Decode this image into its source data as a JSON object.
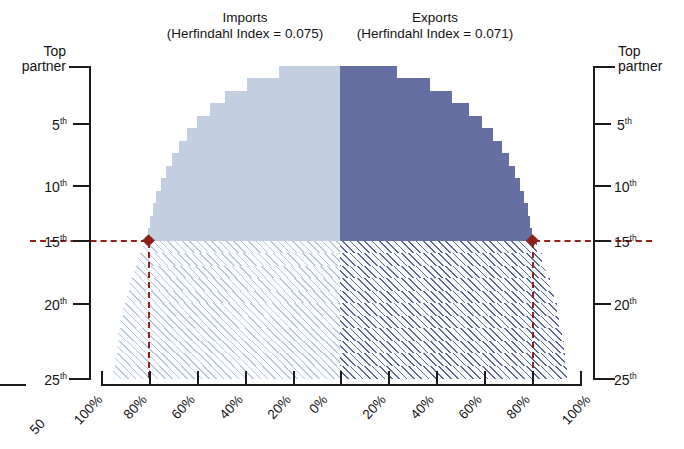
{
  "chart_data": {
    "type": "bar",
    "title": "",
    "subtitle": "",
    "orientation": "horizontal-mirrored",
    "xlabel": "",
    "ylabel": "",
    "panels": [
      {
        "name": "imports",
        "title_line1": "Imports",
        "title_line2": "(Herfindahl Index = 0.075)",
        "herfindahl_index": 0.075,
        "side": "left",
        "color": "#c3cfe0",
        "hatch_color": "#b9c7da",
        "direction": "right-to-left",
        "xlim": [
          0,
          100
        ],
        "categories": [
          "Top partner",
          "2nd",
          "3rd",
          "4th",
          "5th",
          "6th",
          "7th",
          "8th",
          "9th",
          "10th",
          "11th",
          "12th",
          "13th",
          "14th",
          "15th",
          "16th",
          "17th",
          "18th",
          "19th",
          "20th",
          "21st",
          "22nd",
          "23rd",
          "24th",
          "25th"
        ],
        "values": [
          25.5,
          39.0,
          48.0,
          54.5,
          60.0,
          64.0,
          67.5,
          70.5,
          73.0,
          75.0,
          76.8,
          78.2,
          79.4,
          80.2,
          82.5,
          84.5,
          86.3,
          87.9,
          89.3,
          90.6,
          91.7,
          92.7,
          93.5,
          94.2,
          94.8
        ],
        "solid_through_rank": 14,
        "hatched_from_rank": 15
      },
      {
        "name": "exports",
        "title_line1": "Exports",
        "title_line2": "(Herfindahl Index = 0.071)",
        "herfindahl_index": 0.071,
        "side": "right",
        "color": "#666fa2",
        "hatch_color": "#5d6798",
        "direction": "left-to-right",
        "xlim": [
          0,
          100
        ],
        "categories": [
          "Top partner",
          "2nd",
          "3rd",
          "4th",
          "5th",
          "6th",
          "7th",
          "8th",
          "9th",
          "10th",
          "11th",
          "12th",
          "13th",
          "14th",
          "15th",
          "16th",
          "17th",
          "18th",
          "19th",
          "20th",
          "21st",
          "22nd",
          "23rd",
          "24th",
          "25th"
        ],
        "values": [
          24.0,
          37.5,
          47.0,
          54.0,
          59.5,
          64.0,
          67.8,
          70.8,
          73.2,
          75.2,
          77.0,
          78.5,
          79.6,
          80.4,
          82.6,
          84.6,
          86.4,
          88.0,
          89.4,
          90.7,
          91.8,
          92.8,
          93.6,
          94.3,
          94.9
        ],
        "solid_through_rank": 14,
        "hatched_from_rank": 15
      }
    ],
    "y_axis": {
      "label_top": "Top",
      "label_top_second": "partner",
      "ticks": [
        "5th",
        "10th",
        "15th",
        "20th",
        "25th"
      ],
      "tick_ranks": [
        5,
        10,
        15,
        20,
        25
      ],
      "range_ranks": [
        1,
        25
      ],
      "grid": false
    },
    "x_axis_left": {
      "ticks": [
        "100%",
        "80%",
        "60%",
        "40%",
        "20%",
        "0%"
      ],
      "tick_values": [
        100,
        80,
        60,
        40,
        20,
        0
      ],
      "grid": false
    },
    "x_axis_right": {
      "ticks": [
        "0%",
        "20%",
        "40%",
        "60%",
        "80%",
        "100%"
      ],
      "tick_values": [
        0,
        20,
        40,
        60,
        80,
        100
      ],
      "grid": false
    },
    "annotations": [
      {
        "name": "imports-threshold-marker",
        "rank": 14,
        "value_percent": 80,
        "marker": "diamond",
        "color": "#8e2017",
        "guide": "dashed"
      },
      {
        "name": "exports-threshold-marker",
        "rank": 14,
        "value_percent": 80,
        "marker": "diamond",
        "color": "#8e2017",
        "guide": "dashed"
      }
    ],
    "legend": {
      "position": "none",
      "entries": []
    },
    "colors": {
      "imports": "#c3cfe0",
      "exports": "#666fa2",
      "marker": "#8e2017",
      "axis": "#1b1b1b",
      "background": "#ffffff"
    }
  },
  "stray_element": {
    "label": "50"
  }
}
